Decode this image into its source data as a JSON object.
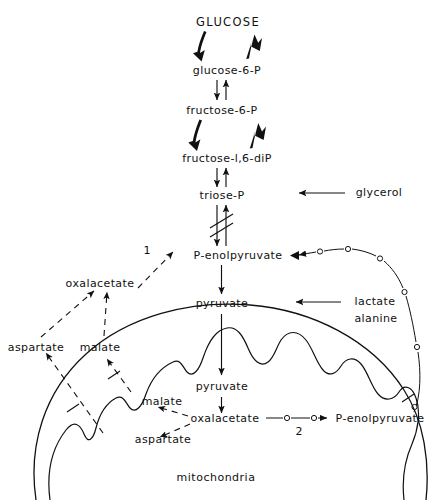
{
  "figure": {
    "title_text": "GLUCOSE",
    "compartment_label": "mitochondria"
  },
  "nodes": {
    "glucose": "GLUCOSE",
    "glucose6p": "glucose-6-P",
    "fructose6p": "fructose-6-P",
    "fructose16dip": "fructose-l,6-diP",
    "triosep": "triose-P",
    "pep_cytosol": "P-enolpyruvate",
    "pyruvate_cytosol": "pyruvate",
    "oxaloacetate_cytosol": "oxalacetate",
    "malate_cytosol": "malate",
    "aspartate_cytosol": "aspartate",
    "pyruvate_mito": "pyruvate",
    "oxaloacetate_mito": "oxalacetate",
    "pep_mito": "P-enolpyruvate",
    "malate_mito": "malate",
    "aspartate_mito": "aspartate",
    "glycerol": "glycerol",
    "lactate": "lactate",
    "alanine": "alanine",
    "mitochondria": "mitochondria"
  },
  "enzyme_markers": {
    "marker_1": "1",
    "marker_2": "2"
  },
  "colors": {
    "ink": "#111111",
    "background": "#ffffff"
  }
}
